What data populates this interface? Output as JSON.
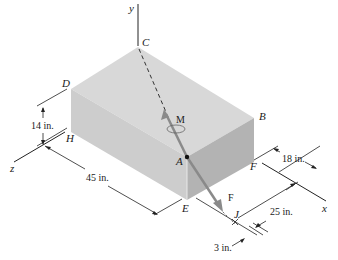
{
  "figure": {
    "axes": {
      "x": "x",
      "y": "y",
      "z": "z"
    },
    "points": {
      "A": "A",
      "B": "B",
      "C": "C",
      "D": "D",
      "E": "E",
      "F": "F",
      "H": "H",
      "J": "J"
    },
    "vectors": {
      "force": "F",
      "moment": "M"
    },
    "dimensions": {
      "height": "14 in.",
      "length": "45 in.",
      "depth": "18 in.",
      "j_offset_x": "25 in.",
      "j_offset_z": "3 in."
    },
    "colors": {
      "top_face": "#d6d6d6",
      "left_face": "#cfcfcf",
      "right_face": "#b5b5b5",
      "line": "#222222",
      "force_arrow": "#8a8a8a"
    }
  }
}
